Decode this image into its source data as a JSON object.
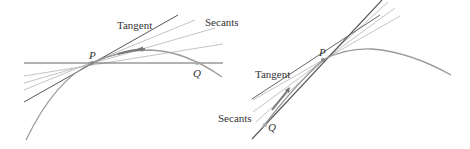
{
  "diagrams": {
    "left": {
      "labels": {
        "tangent": "Tangent",
        "secants": "Secants",
        "point_p": "P",
        "point_q": "Q"
      },
      "description": "Q approaches P from the right along the curve"
    },
    "right": {
      "labels": {
        "tangent": "Tangent",
        "secants": "Secants",
        "point_p": "P",
        "point_q": "Q"
      },
      "description": "Q approaches P from the left along the curve"
    }
  },
  "colors": {
    "curve": "#9a9a9a",
    "tangent": "#555555",
    "secant": "#bdbdbd",
    "text": "#333333"
  }
}
